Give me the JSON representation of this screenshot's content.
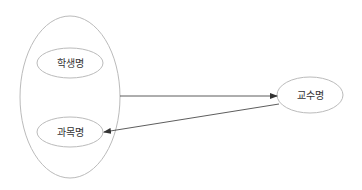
{
  "diagram": {
    "type": "entity-relationship",
    "nodes": {
      "group": {
        "label": ""
      },
      "student_name": {
        "label": "학생명"
      },
      "subject_name": {
        "label": "과목명"
      },
      "professor_name": {
        "label": "교수명"
      }
    },
    "edges": [
      {
        "from": "group",
        "to": "professor_name"
      },
      {
        "from": "professor_name",
        "to": "subject_name"
      }
    ],
    "colors": {
      "stroke": "#bbbbbb",
      "edge": "#333333",
      "text": "#333333"
    }
  }
}
